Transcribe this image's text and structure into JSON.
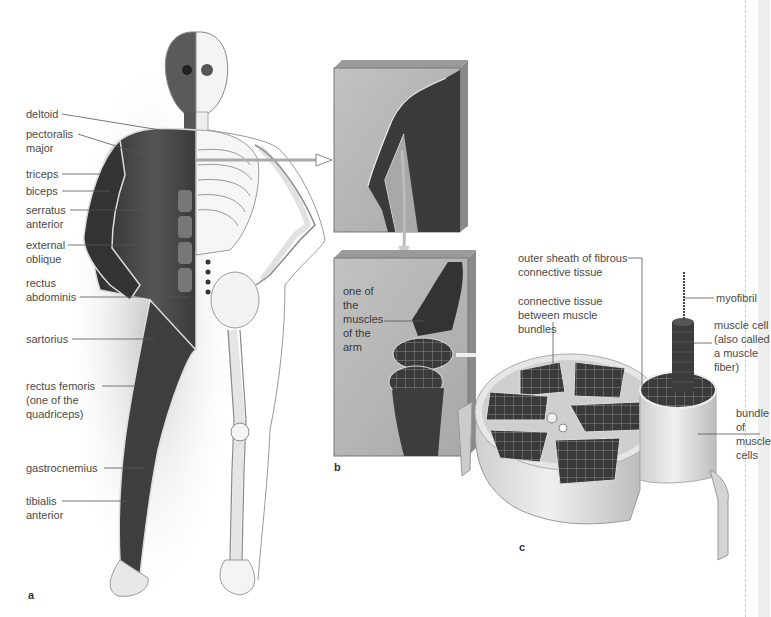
{
  "figure": {
    "panels": [
      {
        "id": "a",
        "letter": "a",
        "description": "Human body, left half muscles, right half skeleton"
      },
      {
        "id": "b",
        "letter": "b",
        "description": "Arm close-up and cut muscle"
      },
      {
        "id": "c",
        "letter": "c",
        "description": "Cross-section of skeletal muscle"
      }
    ]
  },
  "panel_a": {
    "letter": "a",
    "labels": [
      {
        "id": "deltoid",
        "text": "deltoid"
      },
      {
        "id": "pectoralis",
        "text": "pectoralis\nmajor"
      },
      {
        "id": "triceps",
        "text": "triceps"
      },
      {
        "id": "biceps",
        "text": "biceps"
      },
      {
        "id": "serratus",
        "text": "serratus\nanterior"
      },
      {
        "id": "external_oblique",
        "text": "external\noblique"
      },
      {
        "id": "rectus_abdominis",
        "text": "rectus\nabdominis"
      },
      {
        "id": "sartorius",
        "text": "sartorius"
      },
      {
        "id": "rectus_femoris",
        "text": "rectus femoris\n(one of the\nquadriceps)"
      },
      {
        "id": "gastrocnemius",
        "text": "gastrocnemius"
      },
      {
        "id": "tibialis",
        "text": "tibialis\nanterior"
      }
    ]
  },
  "panel_b": {
    "letter": "b",
    "labels": [
      {
        "id": "arm_muscle",
        "text": "one of\nthe\nmuscles\nof the\narm"
      }
    ]
  },
  "panel_c": {
    "letter": "c",
    "labels": [
      {
        "id": "outer_sheath",
        "text": "outer sheath of fibrous\nconnective tissue"
      },
      {
        "id": "connective_between",
        "text": "connective tissue\nbetween muscle\nbundles"
      },
      {
        "id": "myofibril",
        "text": "myofibril"
      },
      {
        "id": "muscle_cell",
        "text": "muscle cell\n(also called\na muscle\nfiber)"
      },
      {
        "id": "bundle",
        "text": "bundle\nof\nmuscle\ncells"
      }
    ]
  },
  "colors": {
    "panel_bg": "#b4b4b4",
    "panel_edge": "#8a8a8a",
    "muscle_dark": "#3c3c3c",
    "bone": "#f2f2f2",
    "sheath": "#d8d8d8",
    "text": "#4a4a4a"
  }
}
